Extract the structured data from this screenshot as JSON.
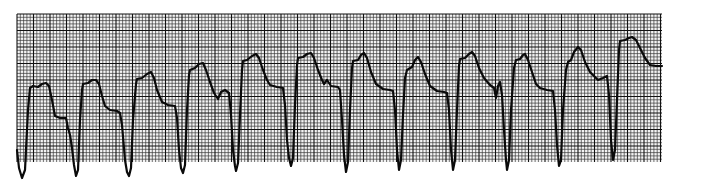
{
  "chart_data": {
    "type": "line",
    "title": "",
    "xlabel": "",
    "ylabel": "",
    "grid": {
      "on": true,
      "x0": 17,
      "y0": 14,
      "x1": 662,
      "y1": 162,
      "minor_px": 3.3,
      "major_every": 5,
      "minor_color": "#3a3a3a",
      "major_color": "#111111",
      "paper_color": "#f4f4f4"
    },
    "trace_color": "#0a0a0a",
    "beats": 12,
    "trough_x": [
      22,
      76,
      129,
      183,
      237,
      291,
      346,
      399,
      453,
      507,
      560,
      613
    ],
    "peak_x": [
      46,
      96,
      151,
      203,
      256,
      311,
      364,
      418,
      472,
      525,
      578,
      632
    ],
    "series": [
      {
        "name": "ECG lead",
        "points": [
          [
            17,
            150
          ],
          [
            19,
            168
          ],
          [
            22,
            178
          ],
          [
            25,
            170
          ],
          [
            28,
            110
          ],
          [
            30,
            88
          ],
          [
            33,
            86
          ],
          [
            38,
            87
          ],
          [
            42,
            84
          ],
          [
            46,
            83
          ],
          [
            49,
            86
          ],
          [
            52,
            100
          ],
          [
            55,
            116
          ],
          [
            60,
            118
          ],
          [
            66,
            118
          ],
          [
            68,
            128
          ],
          [
            70,
            135
          ],
          [
            72,
            148
          ],
          [
            74,
            165
          ],
          [
            76,
            176
          ],
          [
            78,
            170
          ],
          [
            80,
            120
          ],
          [
            82,
            90
          ],
          [
            83,
            84
          ],
          [
            88,
            83
          ],
          [
            92,
            80
          ],
          [
            96,
            80
          ],
          [
            99,
            84
          ],
          [
            102,
            96
          ],
          [
            105,
            106
          ],
          [
            110,
            110
          ],
          [
            117,
            111
          ],
          [
            120,
            113
          ],
          [
            122,
            125
          ],
          [
            125,
            160
          ],
          [
            127,
            172
          ],
          [
            129,
            176
          ],
          [
            131,
            168
          ],
          [
            133,
            120
          ],
          [
            136,
            84
          ],
          [
            137,
            79
          ],
          [
            142,
            78
          ],
          [
            147,
            74
          ],
          [
            151,
            72
          ],
          [
            154,
            78
          ],
          [
            157,
            90
          ],
          [
            162,
            102
          ],
          [
            168,
            105
          ],
          [
            175,
            106
          ],
          [
            177,
            118
          ],
          [
            179,
            150
          ],
          [
            181,
            168
          ],
          [
            183,
            173
          ],
          [
            185,
            165
          ],
          [
            187,
            110
          ],
          [
            189,
            75
          ],
          [
            190,
            70
          ],
          [
            195,
            68
          ],
          [
            199,
            64
          ],
          [
            203,
            63
          ],
          [
            206,
            70
          ],
          [
            210,
            82
          ],
          [
            214,
            93
          ],
          [
            218,
            99
          ],
          [
            221,
            92
          ],
          [
            225,
            90
          ],
          [
            229,
            93
          ],
          [
            231,
            115
          ],
          [
            233,
            150
          ],
          [
            235,
            166
          ],
          [
            236,
            171
          ],
          [
            238,
            163
          ],
          [
            240,
            115
          ],
          [
            242,
            70
          ],
          [
            243,
            61
          ],
          [
            247,
            60
          ],
          [
            252,
            56
          ],
          [
            256,
            54
          ],
          [
            259,
            58
          ],
          [
            263,
            70
          ],
          [
            267,
            80
          ],
          [
            270,
            85
          ],
          [
            277,
            87
          ],
          [
            283,
            88
          ],
          [
            285,
            105
          ],
          [
            287,
            140
          ],
          [
            289,
            158
          ],
          [
            291,
            166
          ],
          [
            293,
            158
          ],
          [
            295,
            105
          ],
          [
            297,
            65
          ],
          [
            298,
            58
          ],
          [
            303,
            57
          ],
          [
            307,
            54
          ],
          [
            311,
            53
          ],
          [
            314,
            58
          ],
          [
            318,
            70
          ],
          [
            322,
            80
          ],
          [
            324,
            84
          ],
          [
            327,
            80
          ],
          [
            331,
            86
          ],
          [
            338,
            87
          ],
          [
            340,
            90
          ],
          [
            342,
            120
          ],
          [
            344,
            155
          ],
          [
            346,
            172
          ],
          [
            348,
            162
          ],
          [
            350,
            110
          ],
          [
            352,
            68
          ],
          [
            353,
            61
          ],
          [
            358,
            60
          ],
          [
            361,
            55
          ],
          [
            364,
            53
          ],
          [
            367,
            58
          ],
          [
            371,
            72
          ],
          [
            376,
            84
          ],
          [
            383,
            89
          ],
          [
            390,
            90
          ],
          [
            393,
            91
          ],
          [
            395,
            110
          ],
          [
            397,
            150
          ],
          [
            399,
            170
          ],
          [
            401,
            160
          ],
          [
            403,
            115
          ],
          [
            405,
            78
          ],
          [
            407,
            70
          ],
          [
            412,
            67
          ],
          [
            415,
            60
          ],
          [
            418,
            57
          ],
          [
            421,
            62
          ],
          [
            425,
            74
          ],
          [
            430,
            86
          ],
          [
            437,
            91
          ],
          [
            444,
            92
          ],
          [
            447,
            93
          ],
          [
            449,
            110
          ],
          [
            451,
            150
          ],
          [
            453,
            170
          ],
          [
            455,
            160
          ],
          [
            457,
            110
          ],
          [
            459,
            66
          ],
          [
            460,
            59
          ],
          [
            465,
            58
          ],
          [
            469,
            54
          ],
          [
            472,
            52
          ],
          [
            475,
            56
          ],
          [
            479,
            68
          ],
          [
            484,
            78
          ],
          [
            490,
            85
          ],
          [
            494,
            88
          ],
          [
            496,
            98
          ],
          [
            498,
            86
          ],
          [
            500,
            82
          ],
          [
            502,
            95
          ],
          [
            504,
            130
          ],
          [
            506,
            160
          ],
          [
            507,
            170
          ],
          [
            509,
            160
          ],
          [
            511,
            110
          ],
          [
            514,
            68
          ],
          [
            516,
            60
          ],
          [
            520,
            59
          ],
          [
            523,
            55
          ],
          [
            525,
            54
          ],
          [
            528,
            60
          ],
          [
            532,
            72
          ],
          [
            536,
            84
          ],
          [
            540,
            88
          ],
          [
            547,
            90
          ],
          [
            553,
            91
          ],
          [
            555,
            110
          ],
          [
            557,
            145
          ],
          [
            559,
            166
          ],
          [
            561,
            160
          ],
          [
            563,
            110
          ],
          [
            566,
            70
          ],
          [
            568,
            62
          ],
          [
            571,
            60
          ],
          [
            574,
            52
          ],
          [
            578,
            47
          ],
          [
            581,
            50
          ],
          [
            585,
            62
          ],
          [
            590,
            72
          ],
          [
            598,
            80
          ],
          [
            603,
            78
          ],
          [
            607,
            76
          ],
          [
            609,
            95
          ],
          [
            611,
            140
          ],
          [
            613,
            160
          ],
          [
            615,
            150
          ],
          [
            617,
            100
          ],
          [
            619,
            50
          ],
          [
            620,
            41
          ],
          [
            625,
            40
          ],
          [
            629,
            38
          ],
          [
            632,
            37
          ],
          [
            636,
            40
          ],
          [
            640,
            48
          ],
          [
            645,
            58
          ],
          [
            650,
            65
          ],
          [
            656,
            66
          ],
          [
            662,
            66
          ]
        ]
      }
    ]
  }
}
